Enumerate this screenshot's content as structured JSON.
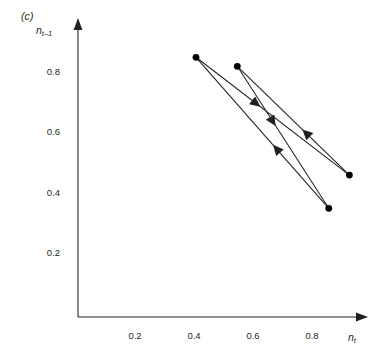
{
  "figure": {
    "panel_label": "(c)",
    "ylabel_main": "n",
    "ylabel_sub": "t–1",
    "xlabel_main": "n",
    "xlabel_sub": "t",
    "line_color": "#231f20",
    "marker_color": "#000000",
    "axis_color": "#231f20",
    "background": "#ffffff"
  },
  "chart_data": {
    "type": "scatter",
    "title": "",
    "subtitle": "",
    "xlabel": "n_t",
    "ylabel": "n_{t-1}",
    "xlim": [
      0,
      1.04
    ],
    "ylim": [
      0,
      0.98
    ],
    "grid": false,
    "legend": null,
    "xticks": [
      0.2,
      0.4,
      0.6,
      0.8
    ],
    "xtick_labels": [
      "0.2",
      "0.4",
      "0.6",
      "0.8"
    ],
    "yticks": [
      0.2,
      0.4,
      0.6,
      0.8
    ],
    "ytick_labels": [
      "0.2",
      "0.4",
      "0.6",
      "0.8"
    ],
    "points": [
      {
        "id": "p1",
        "x": 0.4,
        "y": 0.86
      },
      {
        "id": "p2",
        "x": 0.54,
        "y": 0.83
      },
      {
        "id": "p3",
        "x": 0.92,
        "y": 0.47
      },
      {
        "id": "p4",
        "x": 0.85,
        "y": 0.36
      }
    ],
    "segments": [
      {
        "from": "p1",
        "to": "p3",
        "arrow": "midpoint",
        "direction": "down-right"
      },
      {
        "from": "p3",
        "to": "p2",
        "arrow": "midpoint",
        "direction": "up-left"
      },
      {
        "from": "p2",
        "to": "p4",
        "arrow": "midpoint",
        "direction": "down-right"
      },
      {
        "from": "p4",
        "to": "p1",
        "arrow": "midpoint",
        "direction": "up-left"
      }
    ]
  }
}
